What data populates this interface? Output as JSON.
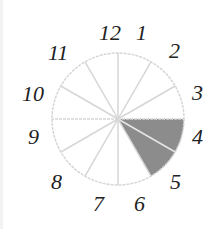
{
  "diagram": {
    "type": "clock-face-sector",
    "center": [
      118,
      119
    ],
    "radius": 66,
    "divisions": 12,
    "shaded_sector": {
      "from_hour": 3,
      "to_hour": 5,
      "segments": 2,
      "color": "#8c8c8c"
    },
    "line_color": "#d6d6d6",
    "labels": [
      {
        "hour": 12,
        "text": "12"
      },
      {
        "hour": 1,
        "text": "1"
      },
      {
        "hour": 2,
        "text": "2"
      },
      {
        "hour": 3,
        "text": "3"
      },
      {
        "hour": 4,
        "text": "4"
      },
      {
        "hour": 5,
        "text": "5"
      },
      {
        "hour": 6,
        "text": "6"
      },
      {
        "hour": 7,
        "text": "7"
      },
      {
        "hour": 8,
        "text": "8"
      },
      {
        "hour": 9,
        "text": "9"
      },
      {
        "hour": 10,
        "text": "10"
      },
      {
        "hour": 11,
        "text": "11"
      }
    ]
  }
}
